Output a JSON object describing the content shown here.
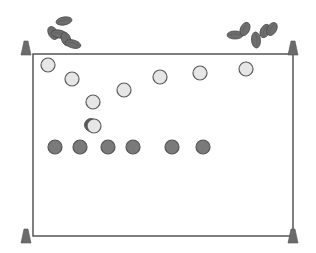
{
  "diagram": {
    "type": "sports-drill",
    "colors": {
      "field_line": "#555555",
      "cone": "#6b6b6b",
      "attacker_fill": "#e6e6e6",
      "attacker_stroke": "#5a5a5a",
      "defender_fill": "#7a7a7a",
      "defender_stroke": "#555555",
      "ball": "#6e6e6e"
    },
    "field": {
      "x": 33,
      "y": 54,
      "width": 260,
      "height": 182
    },
    "cones": [
      {
        "id": "top-left",
        "x": 26,
        "y": 48
      },
      {
        "id": "top-right",
        "x": 293,
        "y": 48
      },
      {
        "id": "bottom-left",
        "x": 26,
        "y": 236
      },
      {
        "id": "bottom-right",
        "x": 293,
        "y": 236
      }
    ],
    "light_players": [
      {
        "x": 48,
        "y": 65
      },
      {
        "x": 72,
        "y": 79
      },
      {
        "x": 124,
        "y": 90
      },
      {
        "x": 93,
        "y": 102
      },
      {
        "x": 160,
        "y": 77
      },
      {
        "x": 200,
        "y": 73
      },
      {
        "x": 246,
        "y": 69
      },
      {
        "x": 94,
        "y": 126
      }
    ],
    "dark_players": [
      {
        "x": 55,
        "y": 147
      },
      {
        "x": 80,
        "y": 147
      },
      {
        "x": 108,
        "y": 147
      },
      {
        "x": 133,
        "y": 147
      },
      {
        "x": 172,
        "y": 147
      },
      {
        "x": 203,
        "y": 147
      }
    ],
    "ball_piles": [
      {
        "id": "left-pile",
        "x": 60,
        "y": 35
      },
      {
        "id": "right-pile",
        "x": 255,
        "y": 35
      }
    ]
  }
}
